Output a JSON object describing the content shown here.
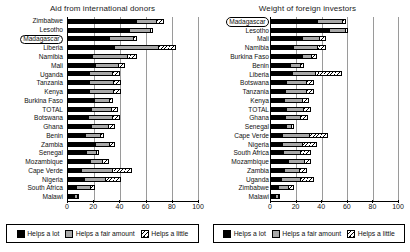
{
  "chart_data": [
    {
      "type": "bar",
      "orientation": "horizontal",
      "stacked": true,
      "title": "Aid from international donors",
      "xlabel": "",
      "ylabel": "",
      "xlim": [
        0,
        100
      ],
      "xticks": [
        0,
        20,
        40,
        60,
        80,
        100
      ],
      "grid": true,
      "legend_position": "bottom",
      "highlight": "Madagascar",
      "categories": [
        "Zimbabwe",
        "Lesotho",
        "Madagascar",
        "Liberia",
        "Namibia",
        "Mali",
        "Uganda",
        "Tanzania",
        "Kenya",
        "Burkina Faso",
        "TOTAL",
        "Botswana",
        "Ghana",
        "Benin",
        "Zambia",
        "Senegal",
        "Mozambique",
        "Cape Verde",
        "Nigeria",
        "South Africa",
        "Malawi"
      ],
      "series": [
        {
          "name": "Helps a lot",
          "values": [
            61,
            58,
            43,
            39,
            25,
            31,
            26,
            25,
            25,
            34,
            29,
            24,
            30,
            25,
            34,
            28,
            30,
            14,
            19,
            14,
            16
          ]
        },
        {
          "name": "Helps a fair amount",
          "values": [
            18,
            20,
            26,
            37,
            37,
            27,
            28,
            29,
            29,
            19,
            24,
            30,
            21,
            21,
            19,
            16,
            17,
            34,
            26,
            22,
            8
          ]
        },
        {
          "name": "Helps a little",
          "values": [
            7,
            3,
            4,
            15,
            11,
            8,
            9,
            10,
            10,
            6,
            9,
            9,
            9,
            7,
            7,
            5,
            9,
            22,
            19,
            10,
            4
          ]
        }
      ]
    },
    {
      "type": "bar",
      "orientation": "horizontal",
      "stacked": true,
      "title": "Weight of foreign investors",
      "xlabel": "",
      "ylabel": "",
      "xlim": [
        0,
        100
      ],
      "xticks": [
        0,
        20,
        40,
        60,
        80,
        100
      ],
      "grid": true,
      "legend_position": "bottom",
      "highlight": "Madagascar",
      "categories": [
        "Madagascar",
        "Lesotho",
        "Mali",
        "Namibia",
        "Burkina Faso",
        "Benin",
        "Liberia",
        "Botswana",
        "Tanzania",
        "Kenya",
        "TOTAL",
        "Ghana",
        "Senegal",
        "Cape Verde",
        "Nigeria",
        "South Africa",
        "Mozambique",
        "Zambia",
        "Uganda",
        "Zimbabwe",
        "Malawi"
      ],
      "series": [
        {
          "name": "Helps a lot",
          "values": [
            47,
            59,
            37,
            26,
            41,
            30,
            22,
            21,
            19,
            18,
            21,
            21,
            28,
            13,
            14,
            17,
            24,
            20,
            14,
            12,
            12
          ]
        },
        {
          "name": "Helps a fair amount",
          "values": [
            26,
            16,
            20,
            29,
            12,
            15,
            24,
            26,
            28,
            26,
            24,
            22,
            9,
            32,
            27,
            24,
            23,
            22,
            25,
            20,
            10
          ]
        },
        {
          "name": "Helps a little",
          "values": [
            4,
            3,
            9,
            11,
            7,
            6,
            29,
            11,
            11,
            11,
            11,
            11,
            6,
            22,
            19,
            15,
            9,
            11,
            19,
            11,
            3
          ]
        }
      ]
    }
  ],
  "legend": {
    "items": [
      {
        "label": "Helps a lot",
        "swatch": "solid-black",
        "color": "#000000"
      },
      {
        "label": "Helps a fair amount",
        "swatch": "solid-gray",
        "color": "#a8a8a8"
      },
      {
        "label": "Helps a little",
        "swatch": "hatched-white",
        "color": "#ffffff"
      }
    ]
  }
}
